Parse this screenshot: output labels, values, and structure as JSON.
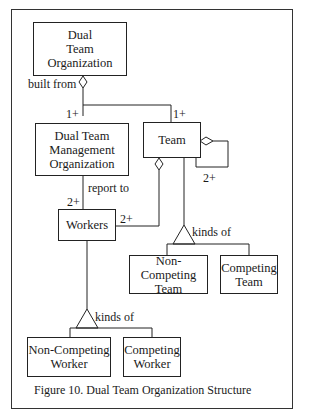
{
  "figure": {
    "caption": "Figure 10. Dual Team Organization Structure"
  },
  "nodes": {
    "dual_team_org": {
      "lines": [
        "Dual",
        "Team",
        "Organization"
      ]
    },
    "mgmt_org": {
      "lines": [
        "Dual Team",
        "Management",
        "Organization"
      ]
    },
    "team": {
      "lines": [
        "Team"
      ]
    },
    "workers": {
      "lines": [
        "Workers"
      ]
    },
    "non_competing_team": {
      "lines": [
        "Non-Competing",
        "Team"
      ]
    },
    "competing_team": {
      "lines": [
        "Competing",
        "Team"
      ]
    },
    "non_competing_worker": {
      "lines": [
        "Non-Competing",
        "Worker"
      ]
    },
    "competing_worker": {
      "lines": [
        "Competing",
        "Worker"
      ]
    }
  },
  "edges": {
    "built_from": "built from",
    "mult_mgmt": "1+",
    "mult_team": "1+",
    "report_to": "report to",
    "mult_workers_report": "2+",
    "mult_workers_team": "2+",
    "mult_team_self": "2+",
    "team_kinds_of": "kinds of",
    "worker_kinds_of": "kinds of"
  },
  "colors": {
    "line": "#222222",
    "background": "#ffffff"
  }
}
